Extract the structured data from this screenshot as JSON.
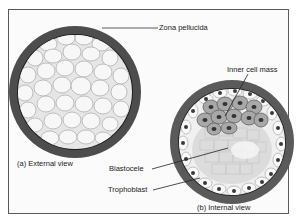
{
  "figure": {
    "panels": [
      {
        "id": "a",
        "caption": "(a) External view"
      },
      {
        "id": "b",
        "caption": "(b) Internal view"
      }
    ],
    "labels": {
      "zona_pellucida": "Zona pellucida",
      "inner_cell_mass": "Inner cell mass",
      "blastocele": "Blastocele",
      "trophoblast": "Trophoblast"
    },
    "colors": {
      "zona": "#4a4a4a",
      "cells": "#f2f2f2",
      "cell_outline": "#b5b5b5",
      "icm_cell": "#9a9a9a",
      "nucleus": "#3a3a3a",
      "frame": "#5a5a5a"
    }
  }
}
